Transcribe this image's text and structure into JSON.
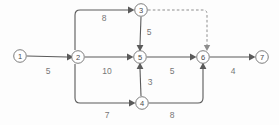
{
  "diagram": {
    "type": "directed-network-graph",
    "title": "",
    "background_color": "#fdfdfd",
    "edge_color": "#5a5a5a",
    "dashed_edge_color": "#8d8d8d",
    "node_stroke_color": "#6e6e6e",
    "label_color": "#777777",
    "nodes": [
      {
        "id": "1",
        "label": "1",
        "x": 20,
        "y": 56
      },
      {
        "id": "2",
        "label": "2",
        "x": 78,
        "y": 57
      },
      {
        "id": "3",
        "label": "3",
        "x": 141,
        "y": 10
      },
      {
        "id": "4",
        "label": "4",
        "x": 142,
        "y": 103
      },
      {
        "id": "5",
        "label": "5",
        "x": 140,
        "y": 57
      },
      {
        "id": "6",
        "label": "6",
        "x": 203,
        "y": 57
      },
      {
        "id": "7",
        "label": "7",
        "x": 262,
        "y": 57
      }
    ],
    "edges": [
      {
        "id": "e1",
        "from": "1",
        "to": "2",
        "weight": "5",
        "style": "solid",
        "label_x": 48,
        "label_y": 71
      },
      {
        "id": "e2",
        "from": "2",
        "to": "3",
        "weight": "8",
        "style": "solid",
        "label_x": 104,
        "label_y": 18
      },
      {
        "id": "e3",
        "from": "3",
        "to": "5",
        "weight": "5",
        "style": "solid",
        "label_x": 149,
        "label_y": 32
      },
      {
        "id": "e4",
        "from": "2",
        "to": "5",
        "weight": "10",
        "style": "solid",
        "label_x": 107,
        "label_y": 71
      },
      {
        "id": "e5",
        "from": "2",
        "to": "4",
        "weight": "7",
        "style": "solid",
        "label_x": 107,
        "label_y": 115
      },
      {
        "id": "e6",
        "from": "4",
        "to": "5",
        "weight": "3",
        "style": "solid",
        "label_x": 150,
        "label_y": 82
      },
      {
        "id": "e7",
        "from": "5",
        "to": "6",
        "weight": "5",
        "style": "solid",
        "label_x": 172,
        "label_y": 71
      },
      {
        "id": "e8",
        "from": "4",
        "to": "6",
        "weight": "8",
        "style": "solid",
        "label_x": 172,
        "label_y": 115
      },
      {
        "id": "e9",
        "from": "6",
        "to": "7",
        "weight": "4",
        "style": "solid",
        "label_x": 233,
        "label_y": 71
      },
      {
        "id": "e10",
        "from": "3",
        "to": "6",
        "weight": "",
        "style": "dashed",
        "label_x": 0,
        "label_y": 0
      }
    ]
  }
}
